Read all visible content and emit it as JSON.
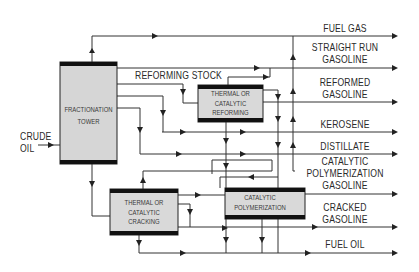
{
  "diagram": {
    "type": "process-flow",
    "colors": {
      "line": "#333333",
      "box_fill": "#d9d9d9",
      "box_bar": "#111111",
      "text": "#2a2a2a"
    },
    "input": {
      "label_line1": "CRUDE",
      "label_line2": "OIL"
    },
    "units": {
      "fractionation": {
        "line1": "FRACTIONATION",
        "line2": "TOWER"
      },
      "reforming": {
        "line1": "THERMAL OR",
        "line2": "CATALYTIC",
        "line3": "REFORMING"
      },
      "cracking": {
        "line1": "THERMAL OR",
        "line2": "CATALYTIC",
        "line3": "CRACKING"
      },
      "polymerization": {
        "line1": "CATALYTIC",
        "line2": "POLYMERIZATION"
      }
    },
    "streams": {
      "reforming_stock": "REFORMING STOCK"
    },
    "outputs": {
      "fuel_gas": {
        "line1": "FUEL GAS"
      },
      "straight_run": {
        "line1": "STRAIGHT RUN",
        "line2": "GASOLINE"
      },
      "reformed": {
        "line1": "REFORMED",
        "line2": "GASOLINE"
      },
      "kerosene": {
        "line1": "KEROSENE"
      },
      "distillate": {
        "line1": "DISTILLATE"
      },
      "cat_poly": {
        "line1": "CATALYTIC",
        "line2": "POLYMERIZATION",
        "line3": "GASOLINE"
      },
      "cracked": {
        "line1": "CRACKED",
        "line2": "GASOLINE"
      },
      "fuel_oil": {
        "line1": "FUEL OIL"
      }
    }
  }
}
